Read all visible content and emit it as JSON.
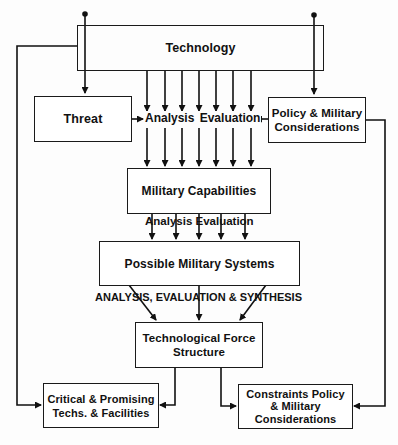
{
  "diagram": {
    "nodes": {
      "technology": {
        "label": "Technology"
      },
      "threat": {
        "label": "Threat"
      },
      "policy": {
        "lines": [
          "Policy & Military",
          "Considerations"
        ]
      },
      "military_capabilities": {
        "label": "Military Capabilities"
      },
      "possible_systems": {
        "label": "Possible Military Systems"
      },
      "force_structure": {
        "lines": [
          "Technological Force",
          "Structure"
        ]
      },
      "critical": {
        "lines": [
          "Critical & Promising",
          "Techs. & Facilities"
        ]
      },
      "constraints": {
        "lines": [
          "Constraints Policy",
          "& Military",
          "Considerations"
        ]
      }
    },
    "edge_labels": {
      "analysis_evaluation_1": "Analysis  Evaluation",
      "analysis_evaluation_2": "Analysis  Evaluation",
      "analysis_synthesis": "ANALYSIS, EVALUATION & SYNTHESIS"
    },
    "edges": [
      "Technology -> Threat",
      "Technology -> Policy & Military Considerations",
      "Technology -> Analysis Evaluation (7 arrows) -> Military Capabilities",
      "Threat -> Analysis Evaluation",
      "Policy & Military Considerations -> Analysis Evaluation",
      "Military Capabilities -> Analysis Evaluation (5 arrows) -> Possible Military Systems",
      "Possible Military Systems -> Analysis, Evaluation & Synthesis -> Technological Force Structure",
      "Technological Force Structure -> Critical & Promising Techs. & Facilities",
      "Technological Force Structure -> Constraints Policy & Military Considerations",
      "Technology -> Critical & Promising Techs. & Facilities",
      "Policy & Military Considerations -> Constraints Policy & Military Considerations"
    ]
  }
}
